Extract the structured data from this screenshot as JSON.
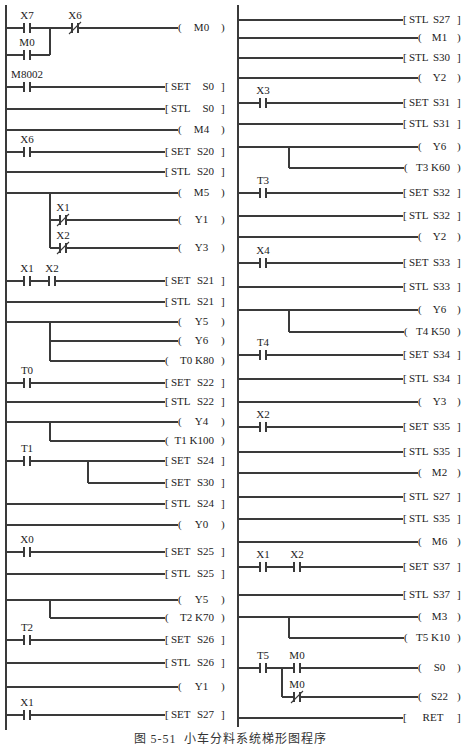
{
  "figure": {
    "caption": "图 5-51  小车分料系统梯形图程序"
  },
  "panels": [
    {
      "id": "left",
      "verticals": [
        {
          "x": 50,
          "y1": 28,
          "y2": 55
        },
        {
          "x": 50,
          "y1": 193,
          "y2": 248
        },
        {
          "x": 50,
          "y1": 322,
          "y2": 361
        },
        {
          "x": 50,
          "y1": 422,
          "y2": 441
        },
        {
          "x": 88,
          "y1": 461,
          "y2": 483
        },
        {
          "x": 50,
          "y1": 600,
          "y2": 618
        }
      ],
      "rungs": [
        {
          "y": 28,
          "contacts": [
            {
              "label": "X7",
              "type": "NO",
              "x": 27
            },
            {
              "label": "X6",
              "type": "NC",
              "x": 75
            }
          ],
          "out": {
            "kind": "coil",
            "text": "M0"
          }
        },
        {
          "y": 55,
          "contacts": [
            {
              "label": "M0",
              "type": "NO",
              "x": 27
            }
          ],
          "end_x": 50
        },
        {
          "y": 87,
          "contacts": [
            {
              "label": "M8002",
              "type": "NO",
              "x": 27
            }
          ],
          "out": {
            "kind": "instr",
            "op": "SET",
            "arg": "S0"
          }
        },
        {
          "y": 109,
          "out": {
            "kind": "instr",
            "op": "STL",
            "arg": "S0"
          }
        },
        {
          "y": 130,
          "out": {
            "kind": "coil",
            "text": "M4"
          }
        },
        {
          "y": 152,
          "contacts": [
            {
              "label": "X6",
              "type": "NO",
              "x": 27
            }
          ],
          "out": {
            "kind": "instr",
            "op": "SET",
            "arg": "S20"
          }
        },
        {
          "y": 172,
          "out": {
            "kind": "instr",
            "op": "STL",
            "arg": "S20"
          }
        },
        {
          "y": 193,
          "out": {
            "kind": "coil",
            "text": "M5"
          }
        },
        {
          "y": 220,
          "start_x": 50,
          "contacts": [
            {
              "label": "X1",
              "type": "NC",
              "x": 63
            }
          ],
          "out": {
            "kind": "coil",
            "text": "Y1"
          }
        },
        {
          "y": 248,
          "start_x": 50,
          "contacts": [
            {
              "label": "X2",
              "type": "NC",
              "x": 63
            }
          ],
          "out": {
            "kind": "coil",
            "text": "Y3"
          }
        },
        {
          "y": 281,
          "contacts": [
            {
              "label": "X1",
              "type": "NO",
              "x": 27
            },
            {
              "label": "X2",
              "type": "NO",
              "x": 52
            }
          ],
          "out": {
            "kind": "instr",
            "op": "SET",
            "arg": "S21"
          }
        },
        {
          "y": 302,
          "out": {
            "kind": "instr",
            "op": "STL",
            "arg": "S21"
          }
        },
        {
          "y": 322,
          "out": {
            "kind": "coil",
            "text": "Y5"
          }
        },
        {
          "y": 341,
          "start_x": 50,
          "out": {
            "kind": "coil",
            "text": "Y6"
          }
        },
        {
          "y": 361,
          "start_x": 50,
          "out": {
            "kind": "coil",
            "text": "T0 K80",
            "wide": true
          }
        },
        {
          "y": 383,
          "contacts": [
            {
              "label": "T0",
              "type": "NO",
              "x": 27
            }
          ],
          "out": {
            "kind": "instr",
            "op": "SET",
            "arg": "S22"
          }
        },
        {
          "y": 402,
          "out": {
            "kind": "instr",
            "op": "STL",
            "arg": "S22"
          }
        },
        {
          "y": 422,
          "out": {
            "kind": "coil",
            "text": "Y4"
          }
        },
        {
          "y": 441,
          "start_x": 50,
          "out": {
            "kind": "coil",
            "text": "T1 K100",
            "wide": true
          }
        },
        {
          "y": 461,
          "contacts": [
            {
              "label": "T1",
              "type": "NO",
              "x": 27
            }
          ],
          "out": {
            "kind": "instr",
            "op": "SET",
            "arg": "S24"
          }
        },
        {
          "y": 483,
          "start_x": 88,
          "out": {
            "kind": "instr",
            "op": "SET",
            "arg": "S30"
          }
        },
        {
          "y": 504,
          "out": {
            "kind": "instr",
            "op": "STL",
            "arg": "S24"
          }
        },
        {
          "y": 525,
          "out": {
            "kind": "coil",
            "text": "Y0"
          }
        },
        {
          "y": 552,
          "contacts": [
            {
              "label": "X0",
              "type": "NO",
              "x": 27
            }
          ],
          "out": {
            "kind": "instr",
            "op": "SET",
            "arg": "S25"
          }
        },
        {
          "y": 574,
          "out": {
            "kind": "instr",
            "op": "STL",
            "arg": "S25"
          }
        },
        {
          "y": 600,
          "out": {
            "kind": "coil",
            "text": "Y5"
          }
        },
        {
          "y": 618,
          "start_x": 50,
          "out": {
            "kind": "coil",
            "text": "T2 K70",
            "wide": true
          }
        },
        {
          "y": 640,
          "contacts": [
            {
              "label": "T2",
              "type": "NO",
              "x": 27
            }
          ],
          "out": {
            "kind": "instr",
            "op": "SET",
            "arg": "S26"
          }
        },
        {
          "y": 663,
          "out": {
            "kind": "instr",
            "op": "STL",
            "arg": "S26"
          }
        },
        {
          "y": 687,
          "out": {
            "kind": "coil",
            "text": "Y1"
          }
        },
        {
          "y": 715,
          "contacts": [
            {
              "label": "X1",
              "type": "NO",
              "x": 27
            }
          ],
          "out": {
            "kind": "instr",
            "op": "SET",
            "arg": "S27"
          }
        }
      ]
    },
    {
      "id": "right",
      "verticals": [
        {
          "x": 289,
          "y1": 147,
          "y2": 168
        },
        {
          "x": 289,
          "y1": 310,
          "y2": 332
        },
        {
          "x": 289,
          "y1": 617,
          "y2": 638
        },
        {
          "x": 282,
          "y1": 668,
          "y2": 697
        }
      ],
      "rungs": [
        {
          "y": 20,
          "out": {
            "kind": "instr",
            "op": "STL",
            "arg": "S27"
          }
        },
        {
          "y": 38,
          "out": {
            "kind": "coil",
            "text": "M1"
          }
        },
        {
          "y": 58,
          "out": {
            "kind": "instr",
            "op": "STL",
            "arg": "S30"
          }
        },
        {
          "y": 78,
          "out": {
            "kind": "coil",
            "text": "Y2"
          }
        },
        {
          "y": 103,
          "contacts": [
            {
              "label": "X3",
              "type": "NO",
              "x": 263
            }
          ],
          "out": {
            "kind": "instr",
            "op": "SET",
            "arg": "S31"
          }
        },
        {
          "y": 124,
          "out": {
            "kind": "instr",
            "op": "STL",
            "arg": "S31"
          }
        },
        {
          "y": 147,
          "out": {
            "kind": "coil",
            "text": "Y6"
          }
        },
        {
          "y": 168,
          "start_x": 289,
          "out": {
            "kind": "coil",
            "text": "T3 K60",
            "wide": true
          }
        },
        {
          "y": 193,
          "contacts": [
            {
              "label": "T3",
              "type": "NO",
              "x": 263
            }
          ],
          "out": {
            "kind": "instr",
            "op": "SET",
            "arg": "S32"
          }
        },
        {
          "y": 216,
          "out": {
            "kind": "instr",
            "op": "STL",
            "arg": "S32"
          }
        },
        {
          "y": 237,
          "out": {
            "kind": "coil",
            "text": "Y2"
          }
        },
        {
          "y": 263,
          "contacts": [
            {
              "label": "X4",
              "type": "NO",
              "x": 263
            }
          ],
          "out": {
            "kind": "instr",
            "op": "SET",
            "arg": "S33"
          }
        },
        {
          "y": 287,
          "out": {
            "kind": "instr",
            "op": "STL",
            "arg": "S33"
          }
        },
        {
          "y": 310,
          "out": {
            "kind": "coil",
            "text": "Y6"
          }
        },
        {
          "y": 332,
          "start_x": 289,
          "out": {
            "kind": "coil",
            "text": "T4 K50",
            "wide": true
          }
        },
        {
          "y": 355,
          "contacts": [
            {
              "label": "T4",
              "type": "NO",
              "x": 263
            }
          ],
          "out": {
            "kind": "instr",
            "op": "SET",
            "arg": "S34"
          }
        },
        {
          "y": 379,
          "out": {
            "kind": "instr",
            "op": "STL",
            "arg": "S34"
          }
        },
        {
          "y": 402,
          "out": {
            "kind": "coil",
            "text": "Y3"
          }
        },
        {
          "y": 427,
          "contacts": [
            {
              "label": "X2",
              "type": "NO",
              "x": 263
            }
          ],
          "out": {
            "kind": "instr",
            "op": "SET",
            "arg": "S35"
          }
        },
        {
          "y": 452,
          "out": {
            "kind": "instr",
            "op": "STL",
            "arg": "S35"
          }
        },
        {
          "y": 473,
          "out": {
            "kind": "coil",
            "text": "M2"
          }
        },
        {
          "y": 497,
          "out": {
            "kind": "instr",
            "op": "STL",
            "arg": "S27"
          }
        },
        {
          "y": 519,
          "out": {
            "kind": "instr",
            "op": "STL",
            "arg": "S35"
          }
        },
        {
          "y": 542,
          "out": {
            "kind": "coil",
            "text": "M6"
          }
        },
        {
          "y": 567,
          "contacts": [
            {
              "label": "X1",
              "type": "NO",
              "x": 263
            },
            {
              "label": "X2",
              "type": "NO",
              "x": 297
            }
          ],
          "out": {
            "kind": "instr",
            "op": "SET",
            "arg": "S37"
          }
        },
        {
          "y": 595,
          "out": {
            "kind": "instr",
            "op": "STL",
            "arg": "S37"
          }
        },
        {
          "y": 617,
          "out": {
            "kind": "coil",
            "text": "M3"
          }
        },
        {
          "y": 638,
          "start_x": 289,
          "out": {
            "kind": "coil",
            "text": "T5 K10",
            "wide": true
          }
        },
        {
          "y": 668,
          "contacts": [
            {
              "label": "T5",
              "type": "NO",
              "x": 263
            },
            {
              "label": "M0",
              "type": "NO",
              "x": 297
            }
          ],
          "out": {
            "kind": "coil",
            "text": "S0"
          }
        },
        {
          "y": 697,
          "start_x": 282,
          "contacts": [
            {
              "label": "M0",
              "type": "NC",
              "x": 297
            }
          ],
          "out": {
            "kind": "coil",
            "text": "S22"
          }
        },
        {
          "y": 718,
          "out": {
            "kind": "instr",
            "op": "RET"
          }
        }
      ]
    }
  ]
}
